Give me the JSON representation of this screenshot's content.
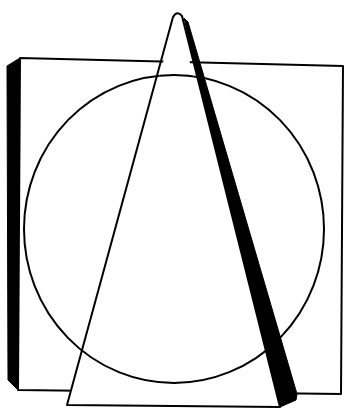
{
  "figure": {
    "background": "#ffffff",
    "ink": "#000000",
    "shapes": [
      {
        "id": "square",
        "label": "Square with shaded left side"
      },
      {
        "id": "circle",
        "label": "Circle"
      },
      {
        "id": "triangle",
        "label": "Triangle with shaded right side"
      }
    ]
  }
}
